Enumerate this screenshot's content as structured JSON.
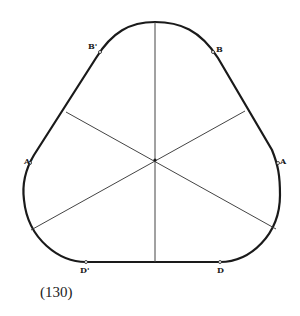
{
  "figure": {
    "caption": "(130)",
    "stroke_color": "#1a1a1a",
    "chord_color": "#444444",
    "center": [
      155,
      160
    ],
    "points": {
      "top": {
        "label": "",
        "x": 155,
        "y": 22
      },
      "B_prime": {
        "label": "B'",
        "x": 100,
        "y": 52
      },
      "B": {
        "label": "B",
        "x": 213,
        "y": 52
      },
      "A_prime": {
        "label": "A'",
        "x": 30,
        "y": 163
      },
      "A": {
        "label": "A",
        "x": 278,
        "y": 163
      },
      "D_prime": {
        "label": "D'",
        "x": 86,
        "y": 262
      },
      "D": {
        "label": "D",
        "x": 220,
        "y": 262
      }
    },
    "chords": [
      {
        "name": "vertical",
        "from": [
          155,
          22
        ],
        "to": [
          155,
          262
        ]
      },
      {
        "name": "upper-left-to-lower-right",
        "from": [
          66,
          112
        ],
        "to": [
          276,
          229
        ]
      },
      {
        "name": "upper-right-to-lower-left",
        "from": [
          245,
          111
        ],
        "to": [
          31,
          230
        ]
      }
    ]
  }
}
